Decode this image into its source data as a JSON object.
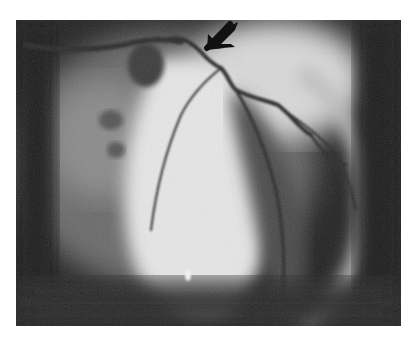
{
  "image": {
    "subject": "coronary angiogram",
    "description": "Grayscale X-ray angiogram of the heart showing contrast-filled coronary arteries; a black arrow points down-left at a narrowed vessel segment near the top center.",
    "annotation": {
      "type": "arrow",
      "color": "#111111",
      "direction": "down-left"
    },
    "palette": {
      "background": "#ffffff",
      "dark": "#1a1a1a",
      "mid": "#7a7a7a",
      "bright": "#eeeeee"
    }
  }
}
